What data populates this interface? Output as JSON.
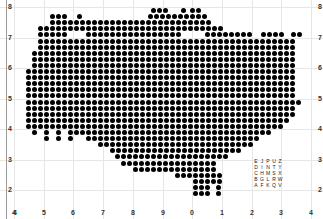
{
  "chart_data": {
    "type": "scatter",
    "title": "",
    "xlabel": "",
    "ylabel": "",
    "x_tick_labels": [
      "4",
      "5",
      "6",
      "7",
      "8",
      "9",
      "0",
      "1",
      "2",
      "3",
      "4"
    ],
    "y_tick_labels_left": [
      "8",
      "7",
      "6",
      "5",
      "4",
      "3",
      "2",
      "4"
    ],
    "y_tick_labels_right": [
      "8",
      "7",
      "6",
      "5",
      "4",
      "3",
      "2"
    ],
    "grid": true,
    "marker": {
      "shape": "circle",
      "color": "#000000",
      "spacing_px": 6
    },
    "rows": [
      {
        "y": 7.9,
        "segments": [
          [
            8.7,
            9.2
          ],
          [
            9.7,
            9.8
          ],
          [
            10.0,
            10.2
          ]
        ]
      },
      {
        "y": 7.7,
        "segments": [
          [
            5.3,
            5.7
          ],
          [
            6.2,
            6.2
          ],
          [
            8.6,
            10.5
          ]
        ]
      },
      {
        "y": 7.5,
        "segments": [
          [
            5.3,
            10.6
          ]
        ]
      },
      {
        "y": 7.3,
        "segments": [
          [
            4.9,
            11.0
          ]
        ]
      },
      {
        "y": 7.1,
        "segments": [
          [
            4.9,
            5.8
          ],
          [
            6.5,
            9.6
          ],
          [
            10.5,
            11.9
          ],
          [
            12.4,
            13.1
          ],
          [
            13.4,
            13.6
          ]
        ]
      },
      {
        "y": 6.9,
        "segments": [
          [
            4.9,
            13.5
          ]
        ]
      },
      {
        "y": 6.7,
        "segments": [
          [
            4.9,
            13.4
          ]
        ]
      },
      {
        "y": 6.5,
        "segments": [
          [
            4.7,
            13.4
          ]
        ]
      },
      {
        "y": 6.3,
        "segments": [
          [
            4.7,
            13.5
          ]
        ]
      },
      {
        "y": 6.1,
        "segments": [
          [
            4.7,
            13.5
          ]
        ]
      },
      {
        "y": 5.9,
        "segments": [
          [
            4.5,
            13.4
          ]
        ]
      },
      {
        "y": 5.7,
        "segments": [
          [
            4.5,
            13.5
          ]
        ]
      },
      {
        "y": 5.5,
        "segments": [
          [
            4.5,
            13.5
          ]
        ]
      },
      {
        "y": 5.3,
        "segments": [
          [
            4.5,
            13.5
          ]
        ]
      },
      {
        "y": 5.1,
        "segments": [
          [
            4.5,
            13.5
          ]
        ]
      },
      {
        "y": 4.9,
        "segments": [
          [
            4.5,
            13.7
          ]
        ]
      },
      {
        "y": 4.7,
        "segments": [
          [
            4.5,
            13.5
          ]
        ]
      },
      {
        "y": 4.5,
        "segments": [
          [
            4.5,
            13.4
          ]
        ]
      },
      {
        "y": 4.3,
        "segments": [
          [
            4.5,
            13.2
          ]
        ]
      },
      {
        "y": 4.1,
        "segments": [
          [
            4.5,
            13.0
          ]
        ]
      },
      {
        "y": 3.9,
        "segments": [
          [
            4.7,
            4.7
          ],
          [
            5.1,
            5.1
          ],
          [
            5.5,
            5.5
          ],
          [
            5.9,
            12.6
          ]
        ]
      },
      {
        "y": 3.7,
        "segments": [
          [
            5.1,
            5.1
          ],
          [
            5.5,
            5.5
          ],
          [
            5.9,
            5.9
          ],
          [
            6.5,
            12.3
          ]
        ]
      },
      {
        "y": 3.5,
        "segments": [
          [
            6.9,
            12.0
          ]
        ]
      },
      {
        "y": 3.3,
        "segments": [
          [
            7.3,
            11.6
          ]
        ]
      },
      {
        "y": 3.1,
        "segments": [
          [
            7.5,
            11.2
          ]
        ]
      },
      {
        "y": 2.9,
        "segments": [
          [
            7.7,
            10.9
          ]
        ]
      },
      {
        "y": 2.7,
        "segments": [
          [
            8.1,
            10.9
          ]
        ]
      },
      {
        "y": 2.5,
        "segments": [
          [
            9.5,
            10.9
          ]
        ]
      },
      {
        "y": 2.3,
        "segments": [
          [
            10.1,
            10.9
          ]
        ]
      },
      {
        "y": 2.1,
        "segments": [
          [
            10.1,
            10.5
          ],
          [
            10.9,
            10.9
          ]
        ]
      },
      {
        "y": 1.9,
        "segments": [
          [
            10.1,
            10.5
          ],
          [
            10.9,
            10.9
          ]
        ]
      }
    ],
    "annotation_letter_grid": [
      [
        "E",
        "J",
        "P",
        "U",
        "Z"
      ],
      [
        "D",
        "I",
        "N",
        "T",
        "Y"
      ],
      [
        "C",
        "H",
        "M",
        "S",
        "X"
      ],
      [
        "B",
        "G",
        "L",
        "R",
        "W"
      ],
      [
        "A",
        "F",
        "K",
        "Q",
        "V"
      ]
    ]
  }
}
